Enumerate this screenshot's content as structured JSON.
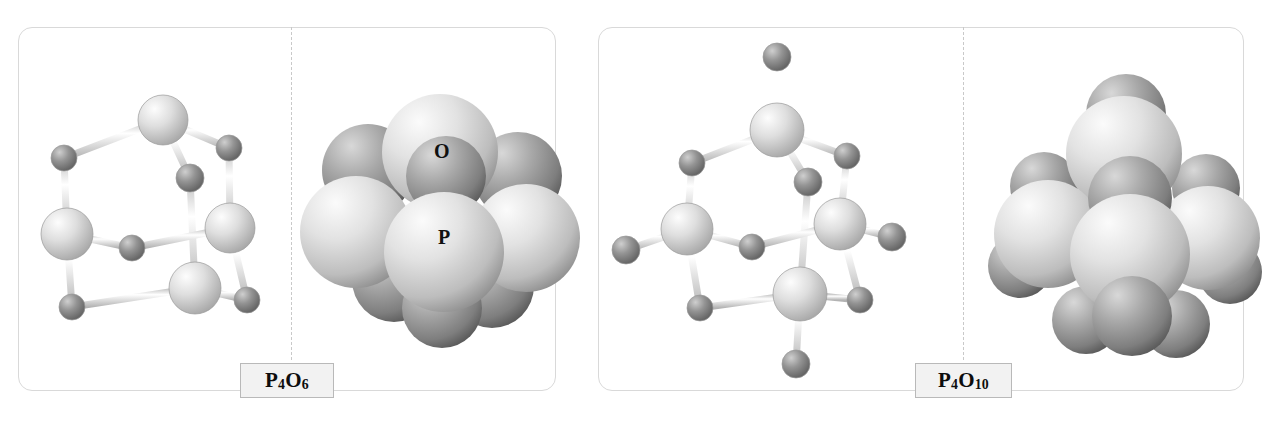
{
  "figure": {
    "background_color": "#ffffff",
    "panel_border_color": "#d9d9d9",
    "divider_color": "#c9c9c9",
    "label_box_fill": "#f2f2f2",
    "label_box_border": "#b9b9b9"
  },
  "legend": {
    "oxygen_label": "O",
    "phosphorus_label": "P",
    "oxygen_color": "#8a8a8a",
    "phosphorus_color": "#d6d6d6"
  },
  "panels": [
    {
      "id": "p4o6",
      "formula_text": "P4O6",
      "formula_element_1": "P",
      "formula_sub_1": "4",
      "formula_element_2": "O",
      "formula_sub_2": "6",
      "ball_stick_caption": "ball-and-stick model",
      "space_filling_caption": "space-filling model",
      "phosphorus_count": 4,
      "oxygen_bridging_count": 6,
      "oxygen_terminal_count": 0
    },
    {
      "id": "p4o10",
      "formula_text": "P4O10",
      "formula_element_1": "P",
      "formula_sub_1": "4",
      "formula_element_2": "O",
      "formula_sub_2": "10",
      "ball_stick_caption": "ball-and-stick model",
      "space_filling_caption": "space-filling model",
      "phosphorus_count": 4,
      "oxygen_bridging_count": 6,
      "oxygen_terminal_count": 4
    }
  ]
}
